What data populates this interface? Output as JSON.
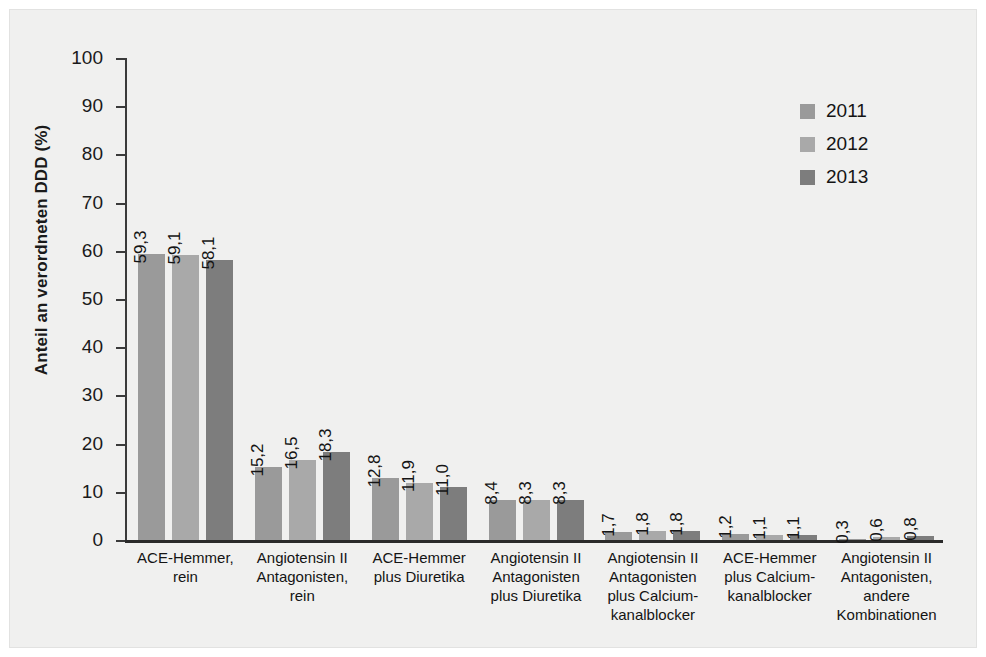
{
  "chart_data": {
    "type": "bar",
    "title": "",
    "subtitle": "",
    "xlabel": "",
    "ylabel": "Anteil an verordneten DDD (%)",
    "ylim": [
      0,
      100
    ],
    "yticks": [
      "100",
      "90",
      "80",
      "70",
      "60",
      "50",
      "40",
      "30",
      "20",
      "10",
      "0"
    ],
    "grid": false,
    "legend_position": "top-right",
    "categories": [
      "ACE-Hemmer,\nrein",
      "Angiotensin II\nAntagonisten,\nrein",
      "ACE-Hemmer\nplus Diuretika",
      "Angiotensin II\nAntagonisten\nplus Diuretika",
      "Angiotensin II\nAntagonisten\nplus Calcium-\nkanalblocker",
      "ACE-Hemmer\nplus Calcium-\nkanalblocker",
      "Angiotensin II\nAntagonisten,\nandere\nKombinationen"
    ],
    "series": [
      {
        "name": "2011",
        "color": "#9a9a9a",
        "values": [
          59.3,
          15.2,
          12.8,
          8.4,
          1.7,
          1.2,
          0.3
        ],
        "labels": [
          "59,3",
          "15,2",
          "12,8",
          "8,4",
          "1,7",
          "1,2",
          "0,3"
        ]
      },
      {
        "name": "2012",
        "color": "#a9a9a9",
        "values": [
          59.1,
          16.5,
          11.9,
          8.3,
          1.8,
          1.1,
          0.6
        ],
        "labels": [
          "59,1",
          "16,5",
          "11,9",
          "8,3",
          "1,8",
          "1,1",
          "0,6"
        ]
      },
      {
        "name": "2013",
        "color": "#7d7d7d",
        "values": [
          58.1,
          18.3,
          11.0,
          8.3,
          1.8,
          1.1,
          0.8
        ],
        "labels": [
          "58,1",
          "18,3",
          "11,0",
          "8,3",
          "1,8",
          "1,1",
          "0,8"
        ]
      }
    ]
  },
  "colors": {
    "panel_background": "#f0f0ef",
    "axis": "#2a2a2a",
    "text": "#141414",
    "series_2011": "#9a9a9a",
    "series_2012": "#a9a9a9",
    "series_2013": "#7d7d7d"
  }
}
